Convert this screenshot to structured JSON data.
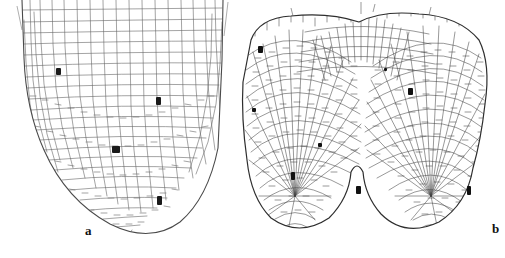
{
  "figure": {
    "type": "scientific-line-drawing",
    "background_color": "#ffffff",
    "ink_color": "#4a4a4a",
    "panel_count": 2
  },
  "panels": [
    {
      "id": "a",
      "label": "a",
      "name": "panel-a-normal-root-apex",
      "description": "Single rounded root apex with elongated cells above and small isodiametric root cap cells at the tip",
      "outline_color": "#555555",
      "cell_wall_color": "#666666",
      "marker_color": "#1a1a1a",
      "marker_count": 4,
      "markers": [
        {
          "x": 56,
          "y": 68,
          "w": 5,
          "h": 7
        },
        {
          "x": 156,
          "y": 97,
          "w": 5,
          "h": 8
        },
        {
          "x": 112,
          "y": 146,
          "w": 8,
          "h": 7
        },
        {
          "x": 157,
          "y": 196,
          "w": 5,
          "h": 9
        }
      ]
    },
    {
      "id": "b",
      "label": "b",
      "name": "panel-b-bifurcated-root-apex",
      "description": "Dichotomously forked root apex with two rounded lobes separated by a central notch",
      "outline_color": "#333333",
      "cell_wall_color": "#444444",
      "marker_color": "#111111",
      "marker_count": 8,
      "markers": [
        {
          "x": 258,
          "y": 46,
          "w": 5,
          "h": 7
        },
        {
          "x": 384,
          "y": 68,
          "w": 3,
          "h": 3
        },
        {
          "x": 408,
          "y": 88,
          "w": 5,
          "h": 7
        },
        {
          "x": 252,
          "y": 108,
          "w": 4,
          "h": 4
        },
        {
          "x": 318,
          "y": 143,
          "w": 4,
          "h": 4
        },
        {
          "x": 291,
          "y": 172,
          "w": 4,
          "h": 8
        },
        {
          "x": 356,
          "y": 186,
          "w": 5,
          "h": 8
        },
        {
          "x": 467,
          "y": 186,
          "w": 4,
          "h": 9
        }
      ]
    }
  ],
  "labels": {
    "panel_a": "a",
    "panel_b": "b"
  }
}
